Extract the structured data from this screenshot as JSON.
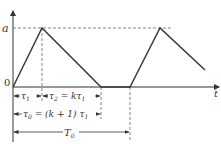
{
  "diagram": {
    "type": "waveform",
    "axes": {
      "y_label": "a",
      "origin_label": "0",
      "x_label": "t"
    },
    "annotations": {
      "tau1": "τ",
      "tau1_sub": "1",
      "tau2_eq": "τ",
      "tau2_sub": "2",
      "tau2_rhs": " = kτ",
      "tau2_rhs_sub": "1",
      "tau0": "τ",
      "tau0_sub": "0",
      "tau0_rhs": " = (k + 1) τ",
      "tau0_rhs_sub": "1",
      "T0": "T",
      "T0_sub": "0"
    },
    "colors": {
      "line": "#333333",
      "dashed": "#555555"
    }
  }
}
